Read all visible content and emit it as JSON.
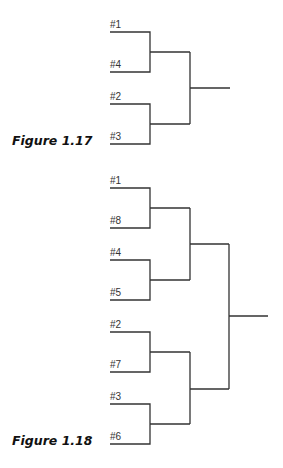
{
  "figures": [
    {
      "caption": "Figure 1.17",
      "seeds": [
        "#1",
        "#4",
        "#2",
        "#3"
      ]
    },
    {
      "caption": "Figure 1.18",
      "seeds": [
        "#1",
        "#8",
        "#4",
        "#5",
        "#2",
        "#7",
        "#3",
        "#6"
      ]
    }
  ],
  "colors": {
    "line": "#333333",
    "text": "#111111"
  }
}
